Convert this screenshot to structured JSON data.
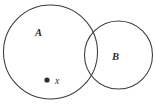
{
  "figure": {
    "type": "venn-diagram",
    "background_color": "#ffffff",
    "stroke_color": "#3a3a42",
    "label_color": "#2b2b31",
    "width": 155,
    "height": 105
  },
  "sets": [
    {
      "id": "A",
      "label": "A",
      "label_x": 35,
      "label_y": 36,
      "center_x": 50.5,
      "center_y": 52,
      "radius": 47
    },
    {
      "id": "B",
      "label": "B",
      "label_x": 112,
      "label_y": 60,
      "center_x": 118.5,
      "center_y": 55,
      "radius": 34
    }
  ],
  "points": [
    {
      "id": "x",
      "label": "x",
      "marker_x": 47,
      "marker_y": 80,
      "marker_radius": 2.6,
      "label_x": 55,
      "label_y": 83.5
    }
  ]
}
